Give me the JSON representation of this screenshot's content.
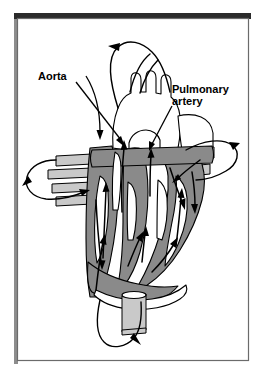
{
  "figure": {
    "background_color": "#ffffff",
    "frame": {
      "border_color": "#6b6b6b",
      "top_bar_color": "#2b2b2b",
      "shadow_color": "#8d8d8d"
    },
    "palette": {
      "muscle_gray": "#8a8a8a",
      "vessel_light": "#ffffff",
      "vessel_mid": "#c9c9c9",
      "outline_black": "#000000"
    },
    "labels": [
      {
        "id": "aorta",
        "text": "Aorta",
        "x": 38,
        "y": 80,
        "anchor": "start",
        "leader_to_x": 122,
        "leader_to_y": 145
      },
      {
        "id": "pulmonary-artery",
        "text_line_1": "Pulmonary",
        "text_line_2": "artery",
        "x": 172,
        "y": 93,
        "anchor": "start",
        "leader_to_x": 152,
        "leader_to_y": 150
      }
    ],
    "circulation_loops": [
      {
        "id": "systemic-upper-loop",
        "description": "Upper body circulation loop above aortic arch"
      },
      {
        "id": "pulmonary-left-loop",
        "description": "Left lung circulation loop"
      },
      {
        "id": "pulmonary-right-loop",
        "description": "Right lung circulation loop"
      },
      {
        "id": "systemic-lower-loop",
        "description": "Lower body circulation loop below heart"
      }
    ],
    "flow_arrow_count": 12
  }
}
